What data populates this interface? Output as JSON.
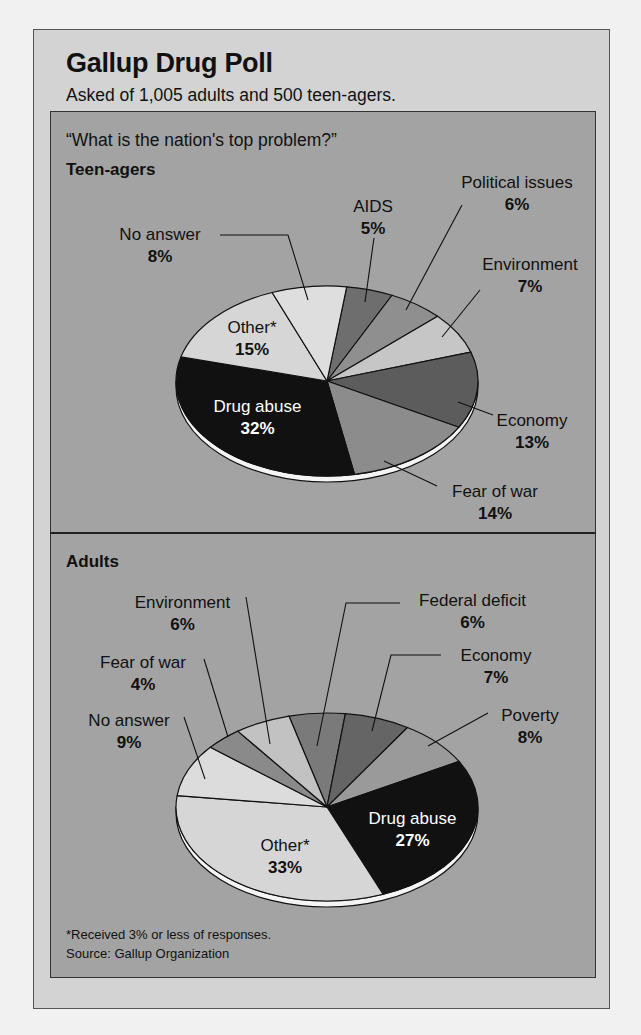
{
  "header": {
    "title": "Gallup Drug Poll",
    "subtitle": "Asked of 1,005 adults and 500 teen-agers."
  },
  "question": "“What is the nation's top problem?”",
  "footnote": "*Received 3% or less of responses.",
  "source": "Source:  Gallup Organization",
  "colors": {
    "card_bg": "#d3d3d3",
    "panel_bg": "#a3a3a3",
    "rim": "#f4f4f4"
  },
  "chart_data": [
    {
      "type": "pie",
      "title": "Teen-agers",
      "question": "What is the nation's top problem?",
      "start_angle_deg": 7.5,
      "direction": "clockwise",
      "slices": [
        {
          "label": "AIDS",
          "value": 5,
          "pct_label": "5%",
          "color": "#6e6e6e"
        },
        {
          "label": "Political issues",
          "value": 6,
          "pct_label": "6%",
          "color": "#8f8f8f"
        },
        {
          "label": "Environment",
          "value": 7,
          "pct_label": "7%",
          "color": "#c6c6c6"
        },
        {
          "label": "Economy",
          "value": 13,
          "pct_label": "13%",
          "color": "#5c5c5c"
        },
        {
          "label": "Fear of war",
          "value": 14,
          "pct_label": "14%",
          "color": "#8c8c8c"
        },
        {
          "label": "Drug abuse",
          "value": 32,
          "pct_label": "32%",
          "color": "#111111"
        },
        {
          "label": "Other*",
          "value": 15,
          "pct_label": "15%",
          "color": "#d6d6d6"
        },
        {
          "label": "No answer",
          "value": 8,
          "pct_label": "8%",
          "color": "#dedede"
        }
      ]
    },
    {
      "type": "pie",
      "title": "Adults",
      "question": "What is the nation's top problem?",
      "start_angle_deg": -14.6,
      "direction": "clockwise",
      "slices": [
        {
          "label": "Federal deficit",
          "value": 6,
          "pct_label": "6%",
          "color": "#7a7a7a"
        },
        {
          "label": "Economy",
          "value": 7,
          "pct_label": "7%",
          "color": "#656565"
        },
        {
          "label": "Poverty",
          "value": 8,
          "pct_label": "8%",
          "color": "#9a9a9a"
        },
        {
          "label": "Drug abuse",
          "value": 27,
          "pct_label": "27%",
          "color": "#111111"
        },
        {
          "label": "Other*",
          "value": 33,
          "pct_label": "33%",
          "color": "#d6d6d6"
        },
        {
          "label": "No answer",
          "value": 9,
          "pct_label": "9%",
          "color": "#dcdcdc"
        },
        {
          "label": "Fear of war",
          "value": 4,
          "pct_label": "4%",
          "color": "#8a8a8a"
        },
        {
          "label": "Environment",
          "value": 6,
          "pct_label": "6%",
          "color": "#c2c2c2"
        }
      ]
    }
  ]
}
